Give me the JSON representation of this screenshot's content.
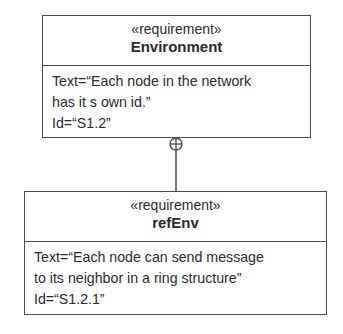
{
  "diagram": {
    "type": "SysML requirement diagram",
    "relationship": {
      "kind": "containment",
      "symbol": "crosshair-circle",
      "from": "Environment",
      "to": "refEnv"
    },
    "requirements": [
      {
        "stereotype": "«requirement»",
        "name": "Environment",
        "text_lines": [
          "Text=“Each node in the network",
          "has it s own id.”",
          "Id=“S1.2”"
        ]
      },
      {
        "stereotype": "«requirement»",
        "name": "refEnv",
        "text_lines": [
          "Text=“Each node can send message",
          "to its neighbor in a ring structure”",
          "Id=“S1.2.1”"
        ]
      }
    ]
  },
  "colors": {
    "line": "#4a4a4a",
    "text": "#2a2a2a",
    "background": "#ffffff"
  }
}
